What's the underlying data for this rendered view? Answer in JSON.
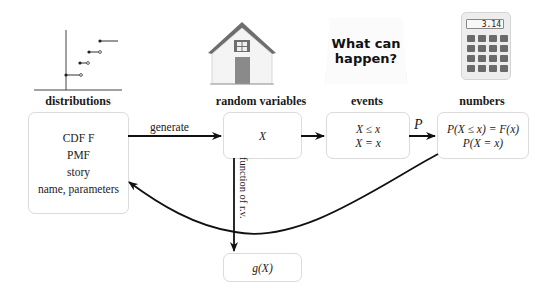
{
  "columns": [
    {
      "id": "distributions",
      "heading": "distributions",
      "icon": "step-cdf-plot-icon",
      "lines": [
        "CDF F",
        "PMF",
        "story",
        "name, parameters"
      ]
    },
    {
      "id": "random_variables",
      "heading": "random variables",
      "icon": "house-icon",
      "lines": [
        "X"
      ]
    },
    {
      "id": "events",
      "heading": "events",
      "icon": "what-can-happen-note-icon",
      "icon_text": [
        "What can",
        "happen?"
      ],
      "lines": [
        "X ≤ x",
        "X = x"
      ]
    },
    {
      "id": "numbers",
      "heading": "numbers",
      "icon": "calculator-icon",
      "calculator_display": "3.14",
      "lines": [
        "P(X ≤ x) = F(x)",
        "P(X = x)"
      ]
    }
  ],
  "function_box": {
    "text": "g(X)"
  },
  "arrows": {
    "generate": "generate",
    "probability": "P",
    "function": "function of r.v."
  },
  "colors": {
    "box_border": "#dcdcdc",
    "arrow": "#111111",
    "house_roof": "#6e6e6e",
    "house_door": "#8a8a8a"
  }
}
